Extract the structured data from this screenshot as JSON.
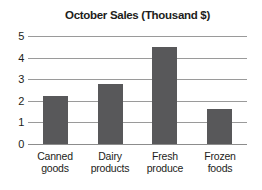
{
  "chart_data": {
    "type": "bar",
    "title": "October Sales (Thousand $)",
    "categories": [
      "Canned goods",
      "Dairy products",
      "Fresh produce",
      "Frozen foods"
    ],
    "values": [
      2.2,
      2.8,
      4.5,
      1.6
    ],
    "xlabel": "",
    "ylabel": "",
    "ylim": [
      0,
      5
    ],
    "yticks": [
      0,
      1,
      2,
      3,
      4,
      5
    ],
    "grid": "horizontal-only",
    "legend": "none",
    "colors": {
      "bar": "#58585a",
      "gridline": "#9a9a9a",
      "baseline": "#8c8c8c",
      "text": "#1d1d20",
      "background": "#ffffff"
    }
  }
}
